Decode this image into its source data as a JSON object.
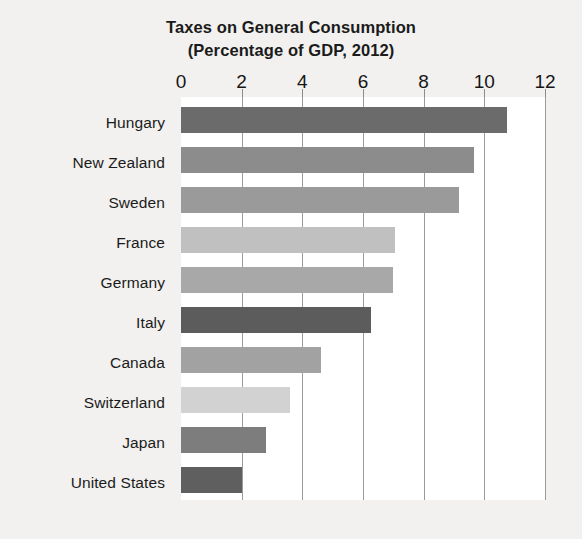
{
  "chart_data": {
    "type": "bar",
    "orientation": "horizontal",
    "title": "Taxes on General Consumption (Percentage of GDP, 2012)",
    "title_lines": [
      "Taxes on General Consumption",
      "(Percentage of GDP, 2012)"
    ],
    "xlabel": "",
    "ylabel": "",
    "xlim": [
      0,
      12
    ],
    "xticks": [
      0,
      2,
      4,
      6,
      8,
      10,
      12
    ],
    "xtick_labels": [
      "0",
      "2",
      "4",
      "6",
      "8",
      "10",
      "12"
    ],
    "grid": true,
    "grid_axis": "x",
    "legend": false,
    "categories": [
      "Hungary",
      "New Zealand",
      "Sweden",
      "France",
      "Germany",
      "Italy",
      "Canada",
      "Switzerland",
      "Japan",
      "United States"
    ],
    "values": [
      10.75,
      9.65,
      9.15,
      7.05,
      7.0,
      6.25,
      4.6,
      3.6,
      2.8,
      2.0
    ],
    "bar_colors": [
      "#6b6b6b",
      "#8c8c8c",
      "#9a9a9a",
      "#c0c0c0",
      "#a8a8a8",
      "#5c5c5c",
      "#a2a2a2",
      "#d2d2d2",
      "#7d7d7d",
      "#5f5f5f"
    ],
    "series": [
      {
        "name": "Taxes on general consumption (% of GDP)",
        "values": [
          10.75,
          9.65,
          9.15,
          7.05,
          7.0,
          6.25,
          4.6,
          3.6,
          2.8,
          2.0
        ]
      }
    ]
  },
  "figure": {
    "background_color": "#f2f1ef",
    "plot_background_color": "#ffffff",
    "gridline_color": "#9a9a9a",
    "text_color": "#1b1b1b"
  }
}
